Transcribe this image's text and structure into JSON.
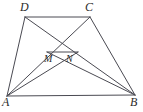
{
  "figure": {
    "type": "geometry-diagram",
    "canvas": {
      "width": 143,
      "height": 112,
      "background": "#ffffff"
    },
    "stroke": {
      "color": "#4a4a52",
      "width": 1
    },
    "label_color": "#2b2b2b",
    "points": {
      "A": {
        "x": 7,
        "y": 96,
        "label": "A",
        "label_x": 2,
        "label_y": 96
      },
      "B": {
        "x": 135,
        "y": 95,
        "label": "B",
        "label_x": 130,
        "label_y": 96
      },
      "C": {
        "x": 90,
        "y": 17,
        "label": "C",
        "label_x": 85,
        "label_y": 1
      },
      "D": {
        "x": 25,
        "y": 17,
        "label": "D",
        "label_x": 20,
        "label_y": 1
      },
      "M": {
        "x": 47,
        "y": 52,
        "label": "M",
        "label_x": 44,
        "label_y": 54
      },
      "N": {
        "x": 78,
        "y": 52,
        "label": "N",
        "label_x": 66,
        "label_y": 54
      }
    },
    "segments": [
      {
        "name": "side-AB",
        "from": "A",
        "to": "B"
      },
      {
        "name": "side-DC",
        "from": "D",
        "to": "C"
      },
      {
        "name": "side-AD",
        "from": "A",
        "to": "D"
      },
      {
        "name": "side-BC",
        "from": "B",
        "to": "C"
      },
      {
        "name": "diagonal-AC",
        "from": "A",
        "to": "C"
      },
      {
        "name": "diagonal-DB",
        "from": "D",
        "to": "B"
      },
      {
        "name": "cevian-AN",
        "from": "A",
        "to": "N"
      },
      {
        "name": "cevian-BM",
        "from": "B",
        "to": "M"
      },
      {
        "name": "segment-MN",
        "from": "M",
        "to": "N"
      }
    ],
    "labels": [
      {
        "key": "D",
        "text": "D",
        "size": "outer"
      },
      {
        "key": "C",
        "text": "C",
        "size": "outer"
      },
      {
        "key": "A",
        "text": "A",
        "size": "outer"
      },
      {
        "key": "B",
        "text": "B",
        "size": "outer"
      },
      {
        "key": "M",
        "text": "M",
        "size": "inner"
      },
      {
        "key": "N",
        "text": "N",
        "size": "inner"
      }
    ]
  }
}
